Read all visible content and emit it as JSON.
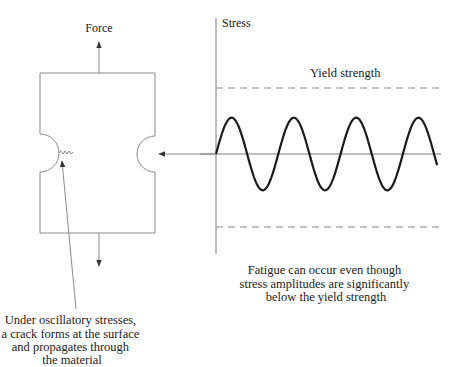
{
  "specimen": {
    "force_label": "Force",
    "crack_caption": [
      "Under oscillatory stresses,",
      "a crack forms at the surface",
      "and propagates through",
      "the material"
    ]
  },
  "graph": {
    "y_axis_label": "Stress",
    "yield_label": "Yield strength",
    "caption": [
      "Fatigue can occur even though",
      "stress amplitudes are significantly",
      "below the yield strength"
    ],
    "wave": {
      "cycles": 3.55,
      "amplitude_fraction_of_yield": 0.5
    }
  },
  "colors": {
    "wave": "#1a1a1a",
    "lines": "#8a8a8a",
    "text": "#222222"
  }
}
